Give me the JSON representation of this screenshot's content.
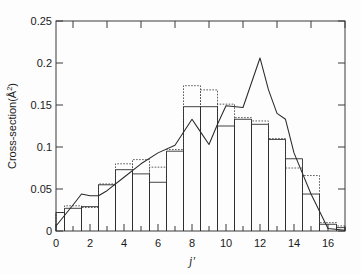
{
  "figure": {
    "name": "cross-section-rotational-distribution",
    "background": "#fdfdfd",
    "ink_color": "#333333"
  },
  "axes": {
    "x": {
      "label": "j'",
      "label_plain": "j",
      "min": 0,
      "max": 17,
      "tick_values": [
        0,
        2,
        4,
        6,
        8,
        10,
        12,
        14,
        16
      ],
      "tick_labels": [
        "0",
        "2",
        "4",
        "6",
        "8",
        "10",
        "12",
        "14",
        "16"
      ],
      "minor_tick_values": [
        1,
        3,
        5,
        7,
        9,
        11,
        13,
        15,
        17
      ],
      "ticks_on_top": true
    },
    "y": {
      "label_prefix": "Cross-section(",
      "label_unit": "Å",
      "label_exponent": "2",
      "label_suffix": ")",
      "label_full": "Cross-section(Å²)",
      "min": 0,
      "max": 0.25,
      "tick_values": [
        0,
        0.05,
        0.1,
        0.15,
        0.2,
        0.25
      ],
      "tick_labels": [
        "0",
        "0.05",
        "0.1",
        "0.15",
        "0.2",
        "0.25"
      ],
      "ticks_on_right": true
    },
    "grid": false,
    "frame": true
  },
  "chart_data": {
    "type": "bar",
    "title": "",
    "subtitle": "",
    "xlabel": "j'",
    "ylabel": "Cross-section(Å²)",
    "xlim": [
      0,
      17
    ],
    "ylim": [
      0,
      0.25
    ],
    "grid": false,
    "legend": "none",
    "categories": [
      0,
      1,
      2,
      3,
      4,
      5,
      6,
      7,
      8,
      9,
      10,
      11,
      12,
      13,
      14,
      15,
      16,
      17
    ],
    "series": [
      {
        "name": "histogram-solid",
        "style": "step-solid",
        "values": [
          0.022,
          0.027,
          0.029,
          0.055,
          0.073,
          0.068,
          0.058,
          0.095,
          0.148,
          0.148,
          0.125,
          0.133,
          0.127,
          0.109,
          0.086,
          0.044,
          0.008,
          0.004
        ]
      },
      {
        "name": "histogram-dotted",
        "style": "step-dotted",
        "values": [
          0.022,
          0.03,
          0.028,
          0.056,
          0.08,
          0.085,
          0.076,
          0.097,
          0.173,
          0.168,
          0.151,
          0.135,
          0.131,
          0.11,
          0.075,
          0.066,
          0.01,
          0.006
        ]
      },
      {
        "name": "smooth-curve",
        "style": "line-solid",
        "x": [
          0,
          1,
          1.5,
          2,
          2.5,
          3,
          4,
          5,
          6,
          7,
          8,
          8.5,
          9,
          9.5,
          10,
          11,
          12,
          12.5,
          13,
          13.5,
          14,
          15,
          16,
          17
        ],
        "values": [
          0.006,
          0.031,
          0.044,
          0.042,
          0.042,
          0.048,
          0.064,
          0.08,
          0.093,
          0.102,
          0.133,
          0.118,
          0.103,
          0.127,
          0.149,
          0.147,
          0.206,
          0.168,
          0.14,
          0.133,
          0.093,
          0.044,
          0.003,
          0.001
        ]
      }
    ]
  }
}
